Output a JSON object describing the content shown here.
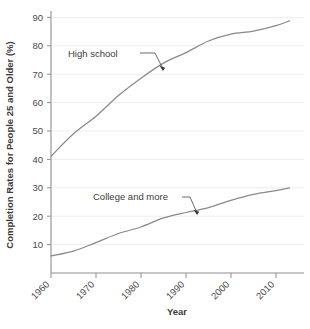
{
  "chart_data": {
    "type": "line",
    "title": "",
    "xlabel": "Year",
    "ylabel": "Completion Rates for People 25 and Older (%)",
    "xlim": [
      1960,
      2013
    ],
    "ylim": [
      0,
      93
    ],
    "xticks": [
      1960,
      1970,
      1980,
      1990,
      2000,
      2010
    ],
    "xticklabels": [
      "1960",
      "1970",
      "1980",
      "1990",
      "2000",
      "2010"
    ],
    "yticks": [
      10,
      20,
      30,
      40,
      50,
      60,
      70,
      80,
      90
    ],
    "yticklabels": [
      "10",
      "20",
      "30",
      "40",
      "50",
      "60",
      "70",
      "80",
      "90"
    ],
    "grid": "horizontal",
    "legend_position": "inline-annotations",
    "line_color": "#8a8a8a",
    "axis_color": "#8f8f8f",
    "grid_color": "#ededed",
    "series": [
      {
        "name": "High school",
        "label": "High school",
        "x": [
          1960,
          1965,
          1970,
          1975,
          1980,
          1985,
          1990,
          1995,
          2000,
          2005,
          2010,
          2013
        ],
        "values": [
          41.1,
          49.0,
          55.2,
          62.5,
          68.6,
          73.9,
          77.6,
          81.7,
          84.1,
          85.2,
          87.1,
          88.8
        ]
      },
      {
        "name": "College and more",
        "label": "College and more",
        "x": [
          1960,
          1965,
          1970,
          1975,
          1980,
          1985,
          1990,
          1995,
          2000,
          2005,
          2010,
          2013
        ],
        "values": [
          6.0,
          7.7,
          10.7,
          13.9,
          16.2,
          19.4,
          21.3,
          23.0,
          25.6,
          27.7,
          29.0,
          30.0
        ]
      }
    ],
    "annotations": [
      {
        "name": "high-school-annotation",
        "text": "High school",
        "text_x": 68,
        "text_y": 57,
        "leader": "M 140 53 L 155 53 L 163 69",
        "arrow_x": 163,
        "arrow_y": 71
      },
      {
        "name": "college-annotation",
        "text": "College and more",
        "text_x": 93,
        "text_y": 200,
        "leader": "M 182 197 L 190 197 L 197 213",
        "arrow_x": 197,
        "arrow_y": 215
      }
    ]
  }
}
